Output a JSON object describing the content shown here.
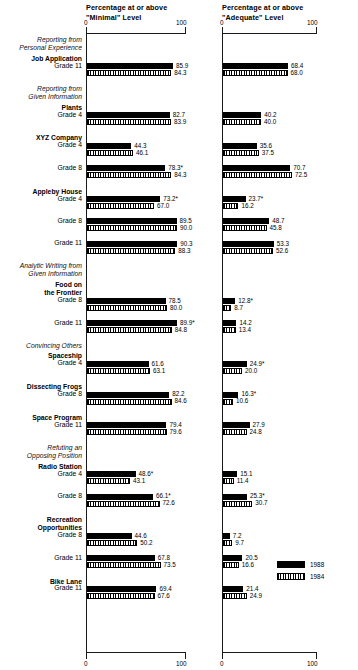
{
  "titles": {
    "left": "Percentage at or above\n\"Minimal\" Level",
    "right": "Percentage at or above\n\"Adequate\" Level"
  },
  "axis": {
    "min_label": "0",
    "max_label": "100"
  },
  "legend": {
    "position": "bottom-right",
    "entries": [
      {
        "label": "1988",
        "swatch": "solid-black"
      },
      {
        "label": "1984",
        "swatch": "hatched"
      }
    ]
  },
  "chart_data": {
    "type": "bar",
    "orientation": "horizontal",
    "panels": [
      {
        "name": "minimal",
        "title": "Percentage at or above \"Minimal\" Level",
        "xlabel": "",
        "xlim": [
          0,
          100
        ],
        "ticks": [
          0,
          100
        ],
        "grid": false
      },
      {
        "name": "adequate",
        "title": "Percentage at or above \"Adequate\" Level",
        "xlabel": "",
        "xlim": [
          0,
          100
        ],
        "ticks": [
          0,
          100
        ],
        "grid": false
      }
    ],
    "series": [
      {
        "name": "1988",
        "swatch": "solid-black"
      },
      {
        "name": "1984",
        "swatch": "hatched"
      }
    ],
    "groups": [
      {
        "heading": "Reporting from\nPersonal Experience",
        "tasks": [
          {
            "task": "Job Application",
            "rows": [
              {
                "grade": "Grade 11",
                "minimal": {
                  "1988": 85.9,
                  "1984": 84.3
                },
                "adequate": {
                  "1988": 68.4,
                  "1984": 68.0
                }
              }
            ]
          }
        ]
      },
      {
        "heading": "Reporting from\nGiven Information",
        "tasks": [
          {
            "task": "Plants",
            "rows": [
              {
                "grade": "Grade 4",
                "minimal": {
                  "1988": 82.7,
                  "1984": 83.9
                },
                "adequate": {
                  "1988": 40.2,
                  "1984": 40.0
                }
              }
            ]
          },
          {
            "task": "XYZ Company",
            "rows": [
              {
                "grade": "Grade 4",
                "minimal": {
                  "1988": 44.3,
                  "1984": 46.1
                },
                "adequate": {
                  "1988": 35.6,
                  "1984": 37.5
                }
              },
              {
                "grade": "Grade 8",
                "minimal": {
                  "1988": 78.3,
                  "1984": 84.3,
                  "1988_sig": true
                },
                "adequate": {
                  "1988": 70.7,
                  "1984": 72.5
                }
              }
            ]
          },
          {
            "task": "Appleby House",
            "rows": [
              {
                "grade": "Grade 4",
                "minimal": {
                  "1988": 73.2,
                  "1984": 67.0,
                  "1988_sig": true
                },
                "adequate": {
                  "1988": 23.7,
                  "1984": 16.2,
                  "1988_sig": true
                }
              },
              {
                "grade": "Grade 8",
                "minimal": {
                  "1988": 89.5,
                  "1984": 90.0
                },
                "adequate": {
                  "1988": 48.7,
                  "1984": 45.8
                }
              },
              {
                "grade": "Grade 11",
                "minimal": {
                  "1988": 90.3,
                  "1984": 88.3
                },
                "adequate": {
                  "1988": 53.3,
                  "1984": 52.6
                }
              }
            ]
          }
        ]
      },
      {
        "heading": "Analytic Writing from\nGiven Information",
        "tasks": [
          {
            "task": "Food on\nthe Frontier",
            "rows": [
              {
                "grade": "Grade 8",
                "minimal": {
                  "1988": 78.5,
                  "1984": 80.0
                },
                "adequate": {
                  "1988": 12.8,
                  "1984": 8.7,
                  "1988_sig": true
                }
              },
              {
                "grade": "Grade 11",
                "minimal": {
                  "1988": 89.9,
                  "1984": 84.8,
                  "1988_sig": true
                },
                "adequate": {
                  "1988": 14.2,
                  "1984": 13.4
                }
              }
            ]
          }
        ]
      },
      {
        "heading": "Convincing Others",
        "tasks": [
          {
            "task": "Spaceship",
            "rows": [
              {
                "grade": "Grade 4",
                "minimal": {
                  "1988": 61.6,
                  "1984": 63.1
                },
                "adequate": {
                  "1988": 24.9,
                  "1984": 20.0,
                  "1988_sig": true
                }
              }
            ]
          },
          {
            "task": "Dissecting Frogs",
            "rows": [
              {
                "grade": "Grade 8",
                "minimal": {
                  "1988": 82.2,
                  "1984": 84.6
                },
                "adequate": {
                  "1988": 16.3,
                  "1984": 10.6,
                  "1988_sig": true
                }
              }
            ]
          },
          {
            "task": "Space Program",
            "rows": [
              {
                "grade": "Grade 11",
                "minimal": {
                  "1988": 79.4,
                  "1984": 79.6
                },
                "adequate": {
                  "1988": 27.9,
                  "1984": 24.8
                }
              }
            ]
          }
        ]
      },
      {
        "heading": "Refuting an\nOpposing Position",
        "tasks": [
          {
            "task": "Radio Station",
            "rows": [
              {
                "grade": "Grade 4",
                "minimal": {
                  "1988": 48.6,
                  "1984": 43.1,
                  "1988_sig": true
                },
                "adequate": {
                  "1988": 15.1,
                  "1984": 11.4
                }
              },
              {
                "grade": "Grade 8",
                "minimal": {
                  "1988": 66.1,
                  "1984": 72.6,
                  "1988_sig": true
                },
                "adequate": {
                  "1988": 25.3,
                  "1984": 30.7,
                  "1988_sig": true
                }
              }
            ]
          },
          {
            "task": "Recreation\nOpportunities",
            "rows": [
              {
                "grade": "Grade 8",
                "minimal": {
                  "1988": 44.6,
                  "1984": 50.2
                },
                "adequate": {
                  "1988": 7.2,
                  "1984": 9.7
                }
              },
              {
                "grade": "Grade 11",
                "minimal": {
                  "1988": 67.8,
                  "1984": 73.5
                },
                "adequate": {
                  "1988": 20.5,
                  "1984": 16.6
                }
              }
            ]
          },
          {
            "task": "Bike Lane",
            "rows": [
              {
                "grade": "Grade 11",
                "minimal": {
                  "1988": 69.4,
                  "1984": 67.6
                },
                "adequate": {
                  "1988": 21.4,
                  "1984": 24.9
                }
              }
            ]
          }
        ]
      }
    ]
  }
}
